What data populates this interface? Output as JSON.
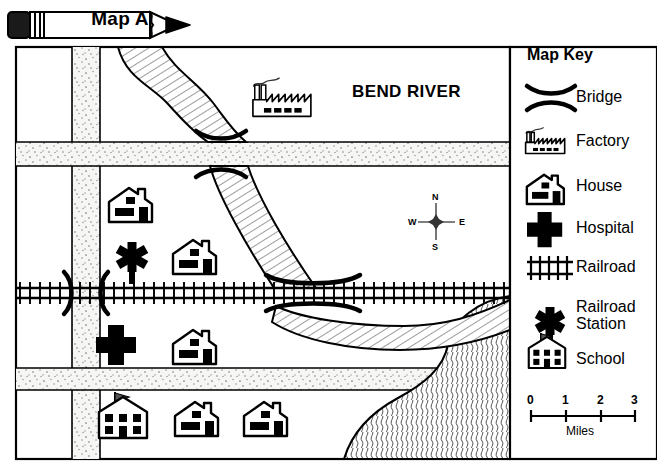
{
  "banner": {
    "title": "Map A",
    "icon": "pencil-banner-icon"
  },
  "map": {
    "river_label": "BEND RIVER",
    "compass": {
      "north": "N",
      "east": "E",
      "south": "S",
      "west": "W"
    },
    "features": [
      {
        "type": "factory",
        "name": "factory-icon"
      },
      {
        "type": "house",
        "name": "house-icon"
      },
      {
        "type": "house",
        "name": "house-icon"
      },
      {
        "type": "railroad-station",
        "name": "railroad-station-icon"
      },
      {
        "type": "hospital",
        "name": "hospital-icon"
      },
      {
        "type": "house",
        "name": "house-icon"
      },
      {
        "type": "school",
        "name": "school-icon"
      },
      {
        "type": "house",
        "name": "house-icon"
      },
      {
        "type": "house",
        "name": "house-icon"
      }
    ]
  },
  "key": {
    "title": "Map Key",
    "items": [
      {
        "label": "Bridge",
        "icon": "bridge-icon"
      },
      {
        "label": "Factory",
        "icon": "factory-icon"
      },
      {
        "label": "House",
        "icon": "house-icon"
      },
      {
        "label": "Hospital",
        "icon": "hospital-icon"
      },
      {
        "label": "Railroad",
        "icon": "railroad-icon"
      },
      {
        "label": "Railroad Station",
        "label_line1": "Railroad",
        "label_line2": "Station",
        "icon": "railroad-station-icon"
      },
      {
        "label": "School",
        "icon": "school-icon"
      }
    ]
  },
  "scale": {
    "ticks": [
      "0",
      "1",
      "2",
      "3"
    ],
    "unit": "Miles"
  },
  "colors": {
    "ink": "#000000",
    "paper": "#ffffff",
    "road_fill": "#f4f4f2",
    "water_fill": "#ffffff"
  }
}
